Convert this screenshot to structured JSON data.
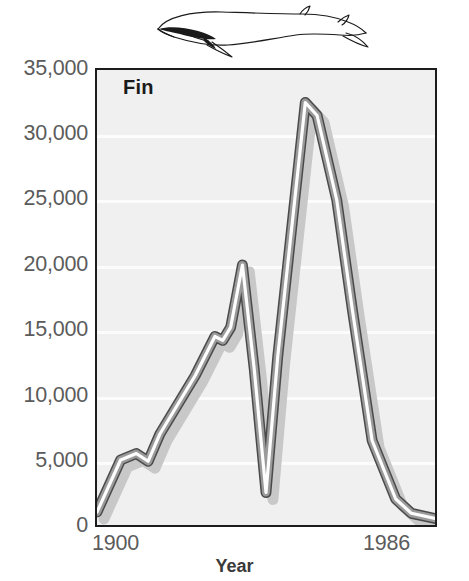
{
  "figure": {
    "series_label": "Fin",
    "whale_icon": "fin-whale-silhouette"
  },
  "chart_data": {
    "type": "line",
    "title": "Fin",
    "xlabel": "Year",
    "ylabel": "",
    "xlim": [
      1900,
      1986
    ],
    "ylim": [
      0,
      35000
    ],
    "grid": true,
    "legend": "none",
    "y_ticks": [
      "0",
      "5,000",
      "10,000",
      "15,000",
      "20,000",
      "25,000",
      "30,000",
      "35,000"
    ],
    "y_tick_values": [
      0,
      5000,
      10000,
      15000,
      20000,
      25000,
      30000,
      35000
    ],
    "x_ticks": [
      "1900",
      "1986"
    ],
    "x_tick_values": [
      1900,
      1986
    ],
    "series_name": "Fin",
    "x": [
      1900,
      1906,
      1910,
      1913,
      1916,
      1925,
      1930,
      1932,
      1934,
      1937,
      1940,
      1943,
      1946,
      1953,
      1956,
      1961,
      1965,
      1970,
      1976,
      1980,
      1986
    ],
    "values": [
      1000,
      5000,
      5500,
      4900,
      7000,
      11500,
      14500,
      14200,
      15200,
      20000,
      12000,
      2500,
      13000,
      32500,
      31500,
      25000,
      16500,
      6500,
      2000,
      900,
      500
    ]
  },
  "axes": {
    "y_labels": [
      "35,000",
      "30,000",
      "25,000",
      "20,000",
      "15,000",
      "10,000",
      "5,000",
      "0"
    ],
    "x_start": "1900",
    "x_end": "1986",
    "x_title": "Year"
  },
  "colors": {
    "plot_background": "#f0f0f0",
    "gridline": "#fcfcfc",
    "frame": "#1c1c1c",
    "line_outline": "#4a4a4a",
    "line_highlight": "#ffffff",
    "line_shadow": "#c4c4c4",
    "axis_text": "#5b5b5b",
    "title_text": "#1a1a1a"
  }
}
